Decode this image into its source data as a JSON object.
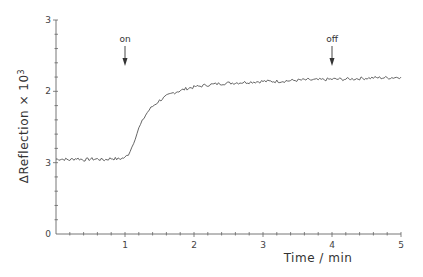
{
  "chart_data": {
    "type": "line",
    "title": "",
    "xlabel": "Time / min",
    "ylabel": "ΔReflection × 10³",
    "ylabel_parts": {
      "prefix": "∆Reflection × 10",
      "sup": "3"
    },
    "xlim": [
      0,
      5
    ],
    "ylim": [
      0,
      3
    ],
    "x_ticks": [
      {
        "value": 1,
        "label": "1"
      },
      {
        "value": 2,
        "label": "2"
      },
      {
        "value": 3,
        "label": "3"
      },
      {
        "value": 4,
        "label": "4"
      },
      {
        "value": 5,
        "label": "5"
      }
    ],
    "x_minor_step": 0.2,
    "y_ticks": [
      {
        "value": 0,
        "label": "0"
      },
      {
        "value": 1,
        "label": "3"
      },
      {
        "value": 2,
        "label": "2"
      },
      {
        "value": 3,
        "label": "3"
      }
    ],
    "y_minor_step": 0.2,
    "grid": false,
    "legend": null,
    "annotations": [
      {
        "text": "on",
        "x": 1.0,
        "arrow_from": 2.75,
        "arrow_to": 2.45
      },
      {
        "text": "off",
        "x": 4.0,
        "arrow_from": 2.75,
        "arrow_to": 2.45
      }
    ],
    "series": [
      {
        "name": "ΔReflection",
        "color": "#555555",
        "x": [
          0.0,
          0.1,
          0.2,
          0.3,
          0.4,
          0.5,
          0.6,
          0.7,
          0.8,
          0.9,
          1.0,
          1.05,
          1.1,
          1.15,
          1.2,
          1.25,
          1.3,
          1.35,
          1.4,
          1.45,
          1.5,
          1.6,
          1.7,
          1.8,
          1.9,
          2.0,
          2.2,
          2.4,
          2.6,
          2.8,
          3.0,
          3.2,
          3.4,
          3.6,
          3.8,
          4.0,
          4.2,
          4.4,
          4.6,
          4.8,
          5.0
        ],
        "values": [
          1.05,
          1.05,
          1.04,
          1.06,
          1.04,
          1.05,
          1.05,
          1.04,
          1.06,
          1.05,
          1.07,
          1.12,
          1.22,
          1.35,
          1.48,
          1.58,
          1.67,
          1.74,
          1.79,
          1.83,
          1.87,
          1.93,
          1.98,
          2.01,
          2.04,
          2.06,
          2.09,
          2.11,
          2.12,
          2.13,
          2.14,
          2.14,
          2.15,
          2.16,
          2.16,
          2.17,
          2.17,
          2.18,
          2.19,
          2.19,
          2.2
        ]
      }
    ]
  }
}
